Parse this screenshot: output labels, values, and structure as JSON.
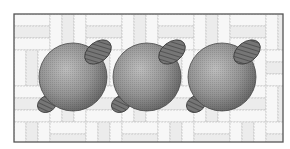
{
  "figure": {
    "frame": {
      "x": 14,
      "y": 14,
      "width": 269,
      "height": 128,
      "stroke": "#555555"
    },
    "background": {
      "tile_fill": "#f7f7f7",
      "tile_stroke": "#b8b8b8",
      "band_fill": "#ececec"
    },
    "spheres": [
      {
        "id": "sphere-1",
        "cx": 73,
        "cy": 77,
        "r": 34
      },
      {
        "id": "sphere-2",
        "cx": 147,
        "cy": 77,
        "r": 34
      },
      {
        "id": "sphere-3",
        "cx": 222,
        "cy": 77,
        "r": 34
      }
    ],
    "lug_offsets": {
      "upper_right": {
        "dx": 25,
        "dy": -25,
        "rx": 15,
        "ry": 10,
        "rotate": -38
      },
      "lower_left": {
        "dx": -26,
        "dy": 27,
        "rx": 10,
        "ry": 8,
        "rotate": -30
      }
    },
    "colors": {
      "sphere_light": "#b9b9b9",
      "sphere_mid": "#8e8e8e",
      "sphere_dark": "#5e5e5e",
      "lug_fill": "#767676",
      "lug_hatch": "#4a4a4a"
    }
  }
}
